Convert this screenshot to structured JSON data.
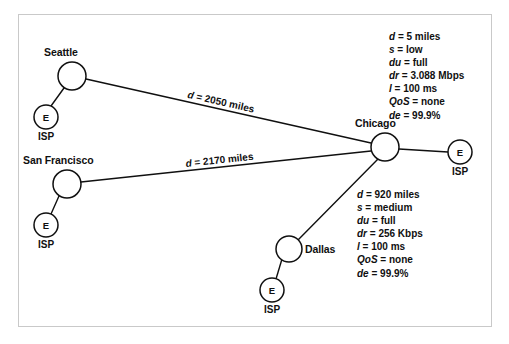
{
  "diagram": {
    "type": "network-topology",
    "title": "",
    "nodes": [
      {
        "id": "seattle",
        "label": "Seattle",
        "kind": "city-router",
        "cx": 72,
        "cy": 76,
        "r": 14
      },
      {
        "id": "san-francisco",
        "label": "San Francisco",
        "kind": "city-router",
        "cx": 67,
        "cy": 184,
        "r": 14
      },
      {
        "id": "dallas",
        "label": "Dallas",
        "kind": "city-router",
        "cx": 289,
        "cy": 249,
        "r": 13
      },
      {
        "id": "chicago",
        "label": "Chicago",
        "kind": "hub-router",
        "cx": 385,
        "cy": 147,
        "r": 14
      },
      {
        "id": "isp-seattle",
        "label": "ISP",
        "kind": "isp",
        "inner": "E",
        "cx": 46,
        "cy": 117,
        "r": 12
      },
      {
        "id": "isp-sf",
        "label": "ISP",
        "kind": "isp",
        "inner": "E",
        "cx": 46,
        "cy": 225,
        "r": 12
      },
      {
        "id": "isp-dallas",
        "label": "ISP",
        "kind": "isp",
        "inner": "E",
        "cx": 272,
        "cy": 290,
        "r": 12
      },
      {
        "id": "isp-chicago",
        "label": "ISP",
        "kind": "isp",
        "inner": "E",
        "cx": 460,
        "cy": 152,
        "r": 12
      }
    ],
    "links": [
      {
        "id": "seattle-chicago",
        "from": "seattle",
        "to": "chicago",
        "label": "d = 2050 miles",
        "label_var": "d",
        "label_rest": " = 2050 miles"
      },
      {
        "id": "sf-chicago",
        "from": "san-francisco",
        "to": "chicago",
        "label": "d = 2170 miles",
        "label_var": "d",
        "label_rest": " = 2170 miles"
      },
      {
        "id": "dallas-chicago",
        "from": "dallas",
        "to": "chicago",
        "label": "",
        "label_var": "",
        "label_rest": ""
      },
      {
        "id": "seattle-isp",
        "from": "seattle",
        "to": "isp-seattle",
        "label": "",
        "label_var": "",
        "label_rest": ""
      },
      {
        "id": "sf-isp",
        "from": "san-francisco",
        "to": "isp-sf",
        "label": "",
        "label_var": "",
        "label_rest": ""
      },
      {
        "id": "dallas-isp",
        "from": "dallas",
        "to": "isp-dallas",
        "label": "",
        "label_var": "",
        "label_rest": ""
      },
      {
        "id": "chicago-isp",
        "from": "chicago",
        "to": "isp-chicago",
        "label": "",
        "label_var": "",
        "label_rest": ""
      }
    ],
    "annotations": [
      {
        "id": "chicago-isp-params",
        "describes": "chicago-isp",
        "rows": [
          {
            "key": "d",
            "value": "5 miles"
          },
          {
            "key": "s",
            "value": "low"
          },
          {
            "key": "du",
            "value": "full"
          },
          {
            "key": "dr",
            "value": "3.088 Mbps"
          },
          {
            "key": "l",
            "value": "100 ms"
          },
          {
            "key": "QoS",
            "value": "none"
          },
          {
            "key": "de",
            "value": "99.9%"
          }
        ]
      },
      {
        "id": "dallas-chicago-params",
        "describes": "dallas-chicago",
        "rows": [
          {
            "key": "d",
            "value": "920 miles"
          },
          {
            "key": "s",
            "value": "medium"
          },
          {
            "key": "du",
            "value": "full"
          },
          {
            "key": "dr",
            "value": "256 Kbps"
          },
          {
            "key": "l",
            "value": "100 ms"
          },
          {
            "key": "QoS",
            "value": "none"
          },
          {
            "key": "de",
            "value": "99.9%"
          }
        ]
      }
    ],
    "colors": {
      "stroke": "#101010",
      "text": "#101010",
      "frame": "#c9c9c9",
      "background": "#ffffff"
    }
  }
}
